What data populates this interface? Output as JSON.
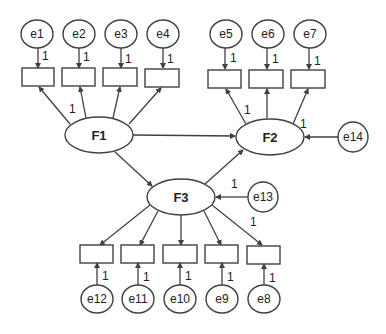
{
  "diagram": {
    "type": "structural-equation-model",
    "colors": {
      "stroke": "#404040",
      "background": "#ffffff",
      "text": "#222222"
    },
    "latents": [
      {
        "id": "F1",
        "label": "F1"
      },
      {
        "id": "F2",
        "label": "F2"
      },
      {
        "id": "F3",
        "label": "F3"
      }
    ],
    "errors": {
      "e1": "e1",
      "e2": "e2",
      "e3": "e3",
      "e4": "e4",
      "e5": "e5",
      "e6": "e6",
      "e7": "e7",
      "e8": "e8",
      "e9": "e9",
      "e10": "e10",
      "e11": "e11",
      "e12": "e12",
      "e13": "e13",
      "e14": "e14"
    },
    "weight": "1",
    "paths": [
      {
        "from": "F1",
        "to": "F2"
      },
      {
        "from": "F1",
        "to": "F3"
      },
      {
        "from": "F3",
        "to": "F2"
      },
      {
        "from": "e13",
        "to": "F3",
        "weight": "1"
      },
      {
        "from": "e14",
        "to": "F2",
        "weight": "1"
      }
    ],
    "indicators": {
      "F1": {
        "count": 4,
        "errors": [
          "e1",
          "e2",
          "e3",
          "e4"
        ],
        "fixed_loading": "1"
      },
      "F2": {
        "count": 3,
        "errors": [
          "e5",
          "e6",
          "e7"
        ],
        "fixed_loading": "1"
      },
      "F3": {
        "count": 5,
        "errors": [
          "e12",
          "e11",
          "e10",
          "e9",
          "e8"
        ],
        "fixed_loading": "1"
      }
    }
  }
}
